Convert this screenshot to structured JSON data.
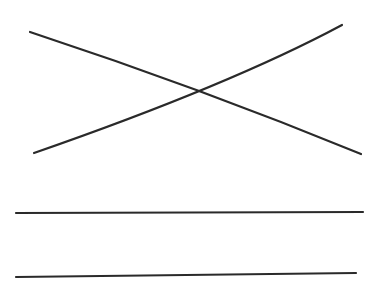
{
  "diagram": {
    "background": "#ffffff",
    "stroke_color": "#2a2a2a",
    "stroke_width": 2.2,
    "lines": [
      {
        "name": "descending-line",
        "d": "M30,32 Q200,88 361,154"
      },
      {
        "name": "ascending-curve",
        "d": "M34,153 Q230,85 342,25"
      },
      {
        "name": "horizontal-line-upper",
        "d": "M16,213 L363,212"
      },
      {
        "name": "horizontal-line-lower",
        "d": "M16,277 L356,273"
      }
    ]
  }
}
